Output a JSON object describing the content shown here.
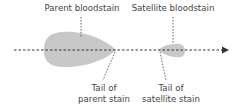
{
  "diagram": {
    "labels": {
      "parent_bloodstain": "Parent bloodstain",
      "satellite_bloodstain": "Satellite bloodstain",
      "parent_tail_line1": "Tail of",
      "parent_tail_line2": "parent stain",
      "satellite_tail_line1": "Tail of",
      "satellite_tail_line2": "satellite stain"
    },
    "colors": {
      "stain_fill": "#c8c8c8",
      "line": "#333333",
      "text": "#444444"
    }
  }
}
